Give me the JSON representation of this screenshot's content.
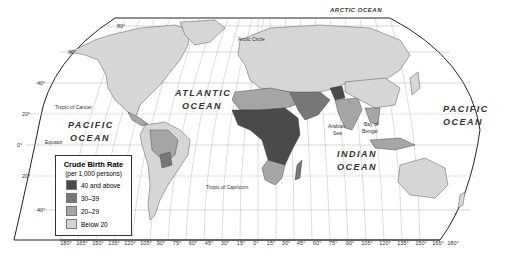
{
  "title": "Crude Birth Rate",
  "legend": {
    "title": "Crude Birth Rate",
    "subtitle": "(per 1,000 persons)",
    "items": [
      {
        "label": "40 and above",
        "color": "#4a4a4a"
      },
      {
        "label": "30–39",
        "color": "#777777"
      },
      {
        "label": "20–29",
        "color": "#a6a6a6"
      },
      {
        "label": "Below 20",
        "color": "#d6d6d6"
      }
    ]
  },
  "oceans": {
    "arctic": "ARCTIC OCEAN",
    "atlantic_1": "ATLANTIC",
    "atlantic_2": "OCEAN",
    "pacific_w_1": "PACIFIC",
    "pacific_w_2": "OCEAN",
    "pacific_e_1": "PACIFIC",
    "pacific_e_2": "OCEAN",
    "indian_1": "INDIAN",
    "indian_2": "OCEAN"
  },
  "features": {
    "arctic_circle": "Arctic Circle",
    "tropic_cancer": "Tropic of Cancer",
    "tropic_capricorn": "Tropic of Capricorn",
    "equator": "Equator",
    "arabian_sea_1": "Arabian",
    "arabian_sea_2": "Sea",
    "bay_bengal_1": "Bay of",
    "bay_bengal_2": "Bengal"
  },
  "latitudes": [
    "80°",
    "60°",
    "40°",
    "20°",
    "0°",
    "20°",
    "40°"
  ],
  "longitudes": [
    "180°",
    "165°",
    "150°",
    "135°",
    "120°",
    "105°",
    "90°",
    "75°",
    "60°",
    "45°",
    "30°",
    "15°",
    "0°",
    "15°",
    "30°",
    "45°",
    "60°",
    "75°",
    "90°",
    "105°",
    "120°",
    "135°",
    "150°",
    "165°",
    "180°"
  ],
  "colors": {
    "land_low": "#d6d6d6",
    "land_20": "#a6a6a6",
    "land_30": "#777777",
    "land_40": "#4a4a4a",
    "ocean": "#ffffff",
    "border": "#333333"
  }
}
